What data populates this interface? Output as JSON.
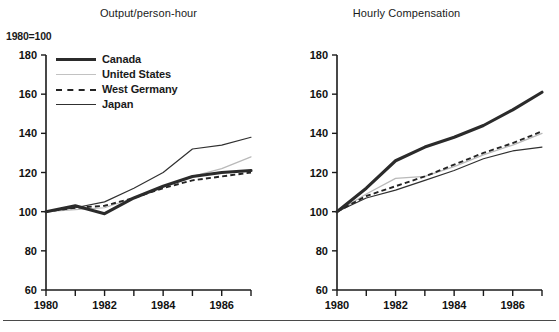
{
  "figure": {
    "index_note": "1980=100",
    "bottom_rule": true
  },
  "legend": {
    "position": "upper-left-inside-left-panel",
    "entries": [
      {
        "label": "Canada",
        "style": "thick-solid-black",
        "color": "#2b2b2b"
      },
      {
        "label": "United States",
        "style": "thin-solid-gray",
        "color": "#b9b9b9"
      },
      {
        "label": "West Germany",
        "style": "dashed-black",
        "color": "#242424"
      },
      {
        "label": "Japan",
        "style": "thin-solid-black",
        "color": "#303030"
      }
    ]
  },
  "chart_data": [
    {
      "type": "line",
      "title": "Output/person-hour",
      "xlabel": "",
      "ylabel": "",
      "ylim": [
        60,
        180
      ],
      "yticks": [
        60,
        80,
        100,
        120,
        140,
        160,
        180
      ],
      "xlim": [
        1980,
        1987
      ],
      "xticks": [
        1980,
        1981,
        1982,
        1983,
        1984,
        1985,
        1986,
        1987
      ],
      "xtick_labels": [
        "1980",
        "",
        "1982",
        "",
        "1984",
        "",
        "1986",
        ""
      ],
      "grid": false,
      "x": [
        1980,
        1981,
        1982,
        1983,
        1984,
        1985,
        1986,
        1987
      ],
      "series": [
        {
          "name": "Canada",
          "values": [
            100,
            103,
            99,
            107,
            113,
            118,
            120,
            121
          ]
        },
        {
          "name": "United States",
          "values": [
            100,
            101,
            102,
            107,
            113,
            118,
            122,
            128
          ]
        },
        {
          "name": "West Germany",
          "values": [
            100,
            102,
            103,
            107,
            112,
            116,
            118,
            120
          ]
        },
        {
          "name": "Japan",
          "values": [
            100,
            102,
            105,
            112,
            120,
            132,
            134,
            138
          ]
        }
      ]
    },
    {
      "type": "line",
      "title": "Hourly Compensation",
      "xlabel": "",
      "ylabel": "",
      "ylim": [
        60,
        180
      ],
      "yticks": [
        60,
        80,
        100,
        120,
        140,
        160,
        180
      ],
      "xlim": [
        1980,
        1987
      ],
      "xticks": [
        1980,
        1981,
        1982,
        1983,
        1984,
        1985,
        1986,
        1987
      ],
      "xtick_labels": [
        "1980",
        "",
        "1982",
        "",
        "1984",
        "",
        "1986",
        ""
      ],
      "grid": false,
      "x": [
        1980,
        1981,
        1982,
        1983,
        1984,
        1985,
        1986,
        1987
      ],
      "series": [
        {
          "name": "Canada",
          "values": [
            100,
            112,
            126,
            133,
            138,
            144,
            152,
            161
          ]
        },
        {
          "name": "United States",
          "values": [
            100,
            109,
            117,
            118,
            123,
            129,
            134,
            140
          ]
        },
        {
          "name": "West Germany",
          "values": [
            100,
            108,
            113,
            118,
            124,
            130,
            135,
            141
          ]
        },
        {
          "name": "Japan",
          "values": [
            100,
            107,
            111,
            116,
            121,
            127,
            131,
            133
          ]
        }
      ]
    }
  ]
}
